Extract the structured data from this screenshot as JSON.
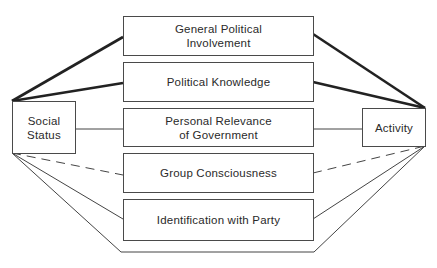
{
  "diagram": {
    "left_node": {
      "label": "Social\nStatus"
    },
    "right_node": {
      "label": "Activity"
    },
    "middle_nodes": [
      {
        "label": "General Political\nInvolvement",
        "link_style": "thick"
      },
      {
        "label": "Political Knowledge",
        "link_style": "thick"
      },
      {
        "label": "Personal Relevance\nof Government",
        "link_style": "thin-horizontal"
      },
      {
        "label": "Group Consciousness",
        "link_style": "dashed"
      },
      {
        "label": "Identification with Party",
        "link_style": "thin"
      }
    ],
    "bottom_path": {
      "link_style": "thin",
      "label": ""
    },
    "colors": {
      "line": "#2a2a2a",
      "box_border": "#4a4a4a",
      "text": "#2a2a2a"
    }
  }
}
